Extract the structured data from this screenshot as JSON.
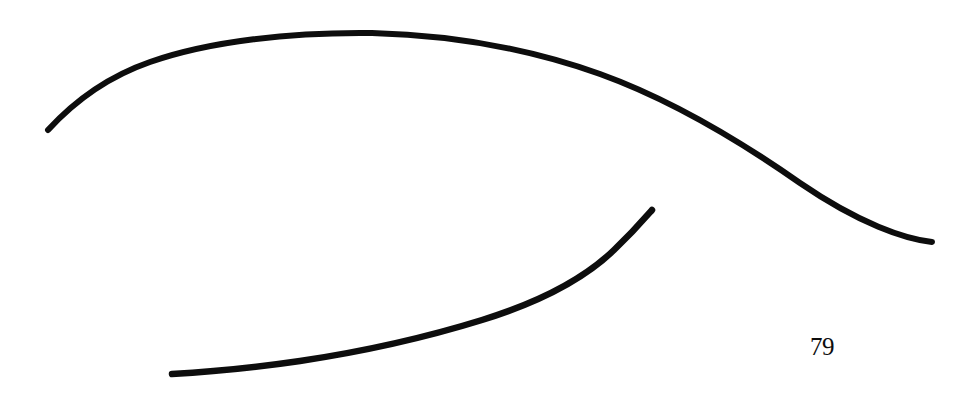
{
  "page": {
    "background_color": "#ffffff",
    "width": 973,
    "height": 399,
    "page_number": "79"
  },
  "figure": {
    "title": "",
    "caption": "",
    "medium": "ink drawing",
    "ink_color": "#0d0d0d",
    "strokes": [
      {
        "name": "upper-arc",
        "description": "long convex arc sweeping from lower-left up over the top and down to the lower-right",
        "stroke_width": 6.0,
        "start_point": [
          48,
          130
        ],
        "apex_point": [
          370,
          33
        ],
        "end_point": [
          932,
          242
        ],
        "path": "M 48,130 C 70,106 104,78 150,62 C 210,41 292,32 372,33 C 452,35 530,49 600,74 C 672,100 740,141 800,183 C 860,224 905,239 932,242"
      },
      {
        "name": "lower-arc",
        "description": "shorter concave arc rising from a near-horizontal left end to a steep upper-right tip",
        "stroke_width": 6.5,
        "start_point": [
          172,
          374
        ],
        "end_point": [
          652,
          210
        ],
        "path": "M 172,374 C 210,372 252,368 300,361 C 360,352 424,338 482,320 C 540,302 584,279 614,250 C 634,231 645,218 652,210"
      }
    ]
  }
}
